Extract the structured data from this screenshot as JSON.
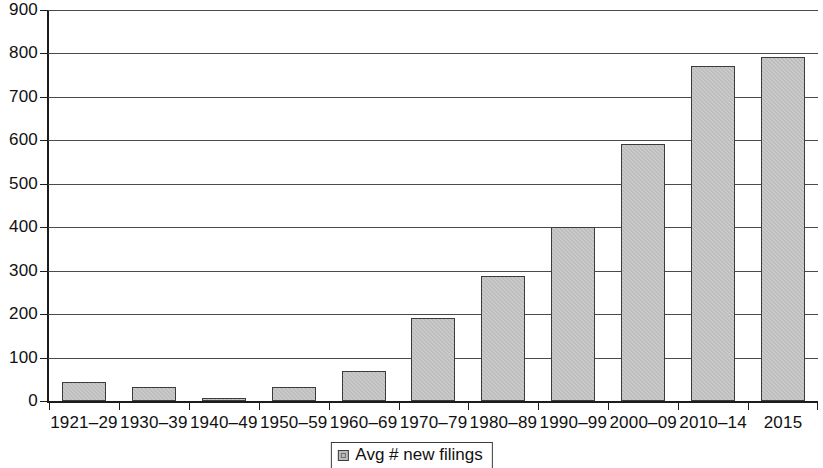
{
  "chart_data": {
    "type": "bar",
    "title": "",
    "subtitle": "",
    "xlabel": "",
    "ylabel": "",
    "ylim": [
      0,
      900
    ],
    "yticks": [
      0,
      100,
      200,
      300,
      400,
      500,
      600,
      700,
      800,
      900
    ],
    "grid": true,
    "legend_position": "bottom-center",
    "categories": [
      "1921–29",
      "1930–39",
      "1940–49",
      "1950–59",
      "1960–69",
      "1970–79",
      "1980–89",
      "1990–99",
      "2000–09",
      "2010–14",
      "2015"
    ],
    "series": [
      {
        "name": "Avg # new filings",
        "values": [
          43,
          33,
          5,
          33,
          68,
          190,
          288,
          400,
          592,
          770,
          792
        ]
      }
    ]
  },
  "legend": {
    "swatch_icon": "legend-square-icon",
    "label": "Avg # new filings"
  },
  "colors": {
    "bar_fill": "#bdbdbd",
    "bar_border": "#3c3c3c",
    "grid_line": "#4a4a4a",
    "axis_line": "#1c1c1c",
    "text": "#111111",
    "background": "#ffffff"
  }
}
